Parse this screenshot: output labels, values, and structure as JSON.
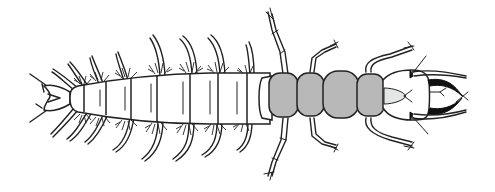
{
  "figure": {
    "alt_text": "Line drawing of an aquatic insect larva (hellgrammite-like) in dorsal view with segmented abdomen bearing lateral filaments and gill tufts, grey-shaded thoracic segments, jointed legs, and a head with pincer-like mandibles pointing right",
    "colors": {
      "background": "#ffffff",
      "outline": "#222222",
      "thorax_fill": "#b8b8b8",
      "labrum_fill": "#e4e6e6",
      "mandible_fill": "#111111"
    },
    "parts": {
      "tail": "anal prolegs with hooks",
      "abdomen_segments": 8,
      "lateral_filament_pairs": 8,
      "thorax_segments": 4,
      "leg_pairs": 3,
      "head": "head capsule with mandibles and antennae"
    }
  }
}
